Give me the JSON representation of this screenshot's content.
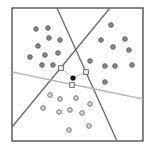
{
  "diagram": {
    "description": "Three point clusters separated by three lines, with a query point linked to the nearest point of each cluster",
    "frame": {
      "x1": 12,
      "y1": 8,
      "x2": 143,
      "y2": 141,
      "stroke": "#444444"
    },
    "lines": [
      {
        "id": "separator-a",
        "x1": 57,
        "y1": 8,
        "x2": 117,
        "y2": 141,
        "stroke": "#6e6e6e",
        "width": 1.4
      },
      {
        "id": "separator-b",
        "x1": 110,
        "y1": 8,
        "x2": 12,
        "y2": 127,
        "stroke": "#6e6e6e",
        "width": 1.4
      },
      {
        "id": "separator-c",
        "x1": 12,
        "y1": 72,
        "x2": 143,
        "y2": 99,
        "stroke": "#b8b8b8",
        "width": 1.6
      }
    ],
    "clusters": [
      {
        "name": "top-left-cluster",
        "style": "filled",
        "fill": "#8a8a8a",
        "stroke": "#555555",
        "points": [
          [
            36,
            29
          ],
          [
            48,
            28
          ],
          [
            49,
            38
          ],
          [
            60,
            40
          ],
          [
            38,
            46
          ],
          [
            30,
            57
          ],
          [
            45,
            55
          ],
          [
            58,
            53
          ],
          [
            42,
            65
          ],
          [
            53,
            65
          ]
        ]
      },
      {
        "name": "right-cluster",
        "style": "filled",
        "fill": "#8a8a8a",
        "stroke": "#555555",
        "points": [
          [
            111,
            25
          ],
          [
            101,
            40
          ],
          [
            125,
            39
          ],
          [
            113,
            47
          ],
          [
            129,
            50
          ],
          [
            90,
            61
          ],
          [
            105,
            66
          ],
          [
            115,
            66
          ],
          [
            132,
            65
          ],
          [
            105,
            82
          ]
        ]
      },
      {
        "name": "bottom-cluster",
        "style": "hollow",
        "fill": "#d9d9d9",
        "stroke": "#666666",
        "points": [
          [
            50,
            95
          ],
          [
            60,
            99
          ],
          [
            76,
            98
          ],
          [
            43,
            108
          ],
          [
            90,
            104
          ],
          [
            59,
            112
          ],
          [
            70,
            110
          ],
          [
            82,
            113
          ],
          [
            69,
            130
          ],
          [
            89,
            126
          ]
        ]
      }
    ],
    "query_point": {
      "x": 73,
      "y": 78,
      "fill": "#111111"
    },
    "nearest_neighbors": [
      {
        "x": 61,
        "y": 68
      },
      {
        "x": 86,
        "y": 72
      },
      {
        "x": 72,
        "y": 85
      }
    ],
    "neighbor_style": {
      "fill": "#ffffff",
      "stroke": "#555555",
      "link_stroke": "#555555"
    }
  }
}
